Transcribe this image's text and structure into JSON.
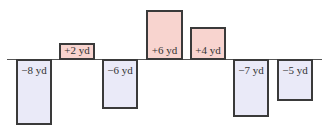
{
  "chart_data": {
    "type": "bar",
    "title": "",
    "xlabel": "",
    "ylabel": "",
    "categories": [
      "1",
      "2",
      "3",
      "4",
      "5",
      "6",
      "7"
    ],
    "values": [
      -8,
      2,
      -6,
      6,
      4,
      -7,
      -5
    ],
    "labels": [
      "−8 yd",
      "+2 yd",
      "−6 yd",
      "+6 yd",
      "+4 yd",
      "−7 yd",
      "−5 yd"
    ],
    "unit": "yd",
    "ylim": [
      -8,
      6
    ],
    "grid": false,
    "legend": null,
    "colors": {
      "positive": "#f8d4cf",
      "negative": "#eaeaf8",
      "border": "#3a3a3a",
      "baseline": "#555555"
    }
  },
  "layout": {
    "baseline_y": 59,
    "baseline_x_start": 7,
    "baseline_x_end": 322,
    "px_per_unit": 8.1,
    "bars": [
      {
        "x": 16,
        "w": 36
      },
      {
        "x": 59,
        "w": 36
      },
      {
        "x": 102,
        "w": 36
      },
      {
        "x": 146,
        "w": 37
      },
      {
        "x": 190,
        "w": 36
      },
      {
        "x": 233,
        "w": 36
      },
      {
        "x": 277,
        "w": 36
      }
    ]
  }
}
